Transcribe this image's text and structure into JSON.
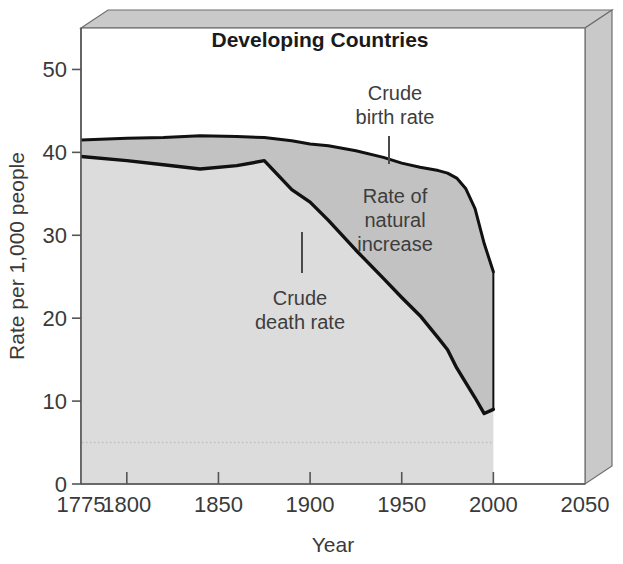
{
  "chart_data": {
    "type": "area",
    "title": "Developing Countries",
    "xlabel": "Year",
    "ylabel": "Rate per 1,000 people",
    "xlim": [
      1775,
      2050
    ],
    "ylim": [
      0,
      55
    ],
    "xticks": [
      "1775",
      "1800",
      "1850",
      "1900",
      "1950",
      "2000",
      "2050"
    ],
    "xtick_values": [
      1775,
      1800,
      1850,
      1900,
      1950,
      2000,
      2050
    ],
    "yticks": [
      "0",
      "10",
      "20",
      "30",
      "40",
      "50"
    ],
    "ytick_values": [
      0,
      10,
      20,
      30,
      40,
      50
    ],
    "grid": false,
    "legend": "none",
    "x": [
      1775,
      1800,
      1820,
      1840,
      1860,
      1875,
      1890,
      1900,
      1910,
      1925,
      1940,
      1950,
      1960,
      1970,
      1975,
      1980,
      1985,
      1990,
      1995,
      2000
    ],
    "series": [
      {
        "name": "Crude birth rate",
        "values": [
          41.5,
          41.7,
          41.8,
          42.0,
          41.9,
          41.8,
          41.4,
          41.0,
          40.8,
          40.2,
          39.4,
          38.7,
          38.2,
          37.8,
          37.5,
          36.9,
          35.6,
          33.2,
          29.0,
          25.6
        ]
      },
      {
        "name": "Crude death rate",
        "values": [
          39.5,
          39.0,
          38.5,
          38.0,
          38.4,
          39.0,
          35.5,
          34.0,
          31.8,
          28.2,
          24.8,
          22.5,
          20.3,
          17.6,
          16.2,
          14.0,
          12.2,
          10.4,
          8.5,
          9.0
        ]
      }
    ],
    "band_label": "Rate of natural increase",
    "reference_line": {
      "value": 5,
      "style": "dotted"
    },
    "colors": {
      "area_below_death": "#dcdcdc",
      "area_natural_increase": "#c2c2c2",
      "line": "#111111",
      "box_face": "#ffffff",
      "box_bevel": "#c9c9c9",
      "text": "#3a3a3a"
    }
  },
  "annotations": {
    "birth": {
      "line1": "Crude",
      "line2": "birth rate"
    },
    "death": {
      "line1": "Crude",
      "line2": "death rate"
    },
    "natural": {
      "line1": "Rate of",
      "line2": "natural",
      "line3": "increase"
    }
  }
}
